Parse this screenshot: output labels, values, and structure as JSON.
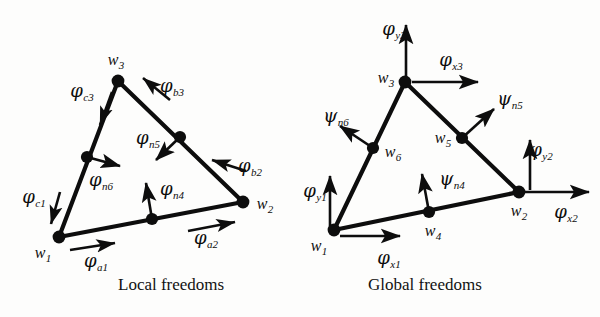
{
  "figure": {
    "type": "finite-element-dof-diagram",
    "background": "#fdfdfc",
    "ink": "#0d0d0d",
    "panels": [
      {
        "id": "local",
        "caption": "Local freedoms"
      },
      {
        "id": "global",
        "caption": "Global freedoms"
      }
    ]
  },
  "captions": {
    "local": "Local freedoms",
    "global": "Global freedoms"
  },
  "local_panel": {
    "nodes": [
      {
        "name": "w1",
        "greek": "w",
        "sub": "1",
        "x": 59,
        "y": 237,
        "label_x": 43,
        "label_y": 254,
        "corner": true
      },
      {
        "name": "w2",
        "greek": "w",
        "sub": "2",
        "x": 243,
        "y": 202,
        "label_x": 265,
        "label_y": 205,
        "corner": true
      },
      {
        "name": "w3",
        "greek": "w",
        "sub": "3",
        "x": 118,
        "y": 81,
        "label_x": 116,
        "label_y": 61,
        "corner": true
      },
      {
        "name": "n4",
        "greek": "w",
        "sub": "4",
        "x": 152,
        "y": 219,
        "label_x": 0,
        "label_y": 0,
        "corner": false
      },
      {
        "name": "n5",
        "greek": "w",
        "sub": "5",
        "x": 180,
        "y": 137,
        "label_x": 0,
        "label_y": 0,
        "corner": false
      },
      {
        "name": "n6",
        "greek": "w",
        "sub": "6",
        "x": 87,
        "y": 157,
        "label_x": 0,
        "label_y": 0,
        "corner": false
      }
    ],
    "edges": [
      {
        "from": "w1",
        "to": "w2",
        "via": "n4"
      },
      {
        "from": "w2",
        "to": "w3",
        "via": "n5"
      },
      {
        "from": "w3",
        "to": "w1",
        "via": "n6"
      }
    ],
    "dofs": [
      {
        "name": "phi_a1",
        "greek": "φ",
        "sub": "a1",
        "label_x": 96,
        "label_y": 262,
        "kind": "tangential",
        "edge": "a"
      },
      {
        "name": "phi_a2",
        "greek": "φ",
        "sub": "a2",
        "label_x": 206,
        "label_y": 239,
        "kind": "tangential",
        "edge": "a"
      },
      {
        "name": "phi_b2",
        "greek": "φ",
        "sub": "b2",
        "label_x": 250,
        "label_y": 167,
        "kind": "tangential",
        "edge": "b"
      },
      {
        "name": "phi_b3",
        "greek": "φ",
        "sub": "b3",
        "label_x": 172,
        "label_y": 87,
        "kind": "tangential",
        "edge": "b"
      },
      {
        "name": "phi_c1",
        "greek": "φ",
        "sub": "c1",
        "label_x": 34,
        "label_y": 198,
        "kind": "tangential",
        "edge": "c"
      },
      {
        "name": "phi_c3",
        "greek": "φ",
        "sub": "c3",
        "label_x": 82,
        "label_y": 92,
        "kind": "tangential",
        "edge": "c"
      },
      {
        "name": "phi_n4",
        "greek": "φ",
        "sub": "n4",
        "label_x": 172,
        "label_y": 190,
        "kind": "normal",
        "node": "n4"
      },
      {
        "name": "phi_n5",
        "greek": "φ",
        "sub": "n5",
        "label_x": 148,
        "label_y": 139,
        "kind": "normal",
        "node": "n5"
      },
      {
        "name": "phi_n6",
        "greek": "φ",
        "sub": "n6",
        "label_x": 101,
        "label_y": 181,
        "kind": "normal",
        "node": "n6"
      }
    ]
  },
  "global_panel": {
    "nodes": [
      {
        "name": "w1",
        "greek": "w",
        "sub": "1",
        "x": 334,
        "y": 230,
        "label_x": 319,
        "label_y": 247,
        "corner": true
      },
      {
        "name": "w2",
        "greek": "w",
        "sub": "2",
        "x": 519,
        "y": 192,
        "label_x": 519,
        "label_y": 212,
        "corner": true
      },
      {
        "name": "w3",
        "greek": "w",
        "sub": "3",
        "x": 405,
        "y": 82,
        "label_x": 386,
        "label_y": 79,
        "corner": true
      },
      {
        "name": "w4",
        "greek": "w",
        "sub": "4",
        "x": 429,
        "y": 212,
        "label_x": 433,
        "label_y": 232,
        "corner": false
      },
      {
        "name": "w5",
        "greek": "w",
        "sub": "5",
        "x": 462,
        "y": 138,
        "label_x": 443,
        "label_y": 139,
        "corner": false
      },
      {
        "name": "w6",
        "greek": "w",
        "sub": "6",
        "x": 373,
        "y": 148,
        "label_x": 393,
        "label_y": 153,
        "corner": false
      }
    ],
    "edges": [
      {
        "from": "w1",
        "to": "w2",
        "via": "w4"
      },
      {
        "from": "w2",
        "to": "w3",
        "via": "w5"
      },
      {
        "from": "w3",
        "to": "w1",
        "via": "w6"
      }
    ],
    "dofs": [
      {
        "name": "phi_x1",
        "greek": "φ",
        "sub": "x1",
        "label_x": 389,
        "label_y": 259,
        "kind": "x",
        "node": "w1"
      },
      {
        "name": "phi_y1",
        "greek": "φ",
        "sub": "y1",
        "label_x": 315,
        "label_y": 192,
        "kind": "y",
        "node": "w1"
      },
      {
        "name": "phi_x2",
        "greek": "φ",
        "sub": "x2",
        "label_x": 566,
        "label_y": 213,
        "kind": "x",
        "node": "w2"
      },
      {
        "name": "phi_y2",
        "greek": "φ",
        "sub": "y2",
        "label_x": 541,
        "label_y": 151,
        "kind": "y",
        "node": "w2"
      },
      {
        "name": "phi_x3",
        "greek": "φ",
        "sub": "x3",
        "label_x": 451,
        "label_y": 61,
        "kind": "x",
        "node": "w3"
      },
      {
        "name": "phi_y3",
        "greek": "φ",
        "sub": "y3",
        "label_x": 394,
        "label_y": 30,
        "kind": "y",
        "node": "w3"
      },
      {
        "name": "psi_n4",
        "greek": "ψ",
        "sub": "n4",
        "label_x": 452,
        "label_y": 180,
        "kind": "normal",
        "node": "w4"
      },
      {
        "name": "psi_n5",
        "greek": "ψ",
        "sub": "n5",
        "label_x": 510,
        "label_y": 100,
        "kind": "normal",
        "node": "w5"
      },
      {
        "name": "psi_n6",
        "greek": "ψ",
        "sub": "n6",
        "label_x": 336,
        "label_y": 117,
        "kind": "normal",
        "node": "w6"
      }
    ]
  }
}
